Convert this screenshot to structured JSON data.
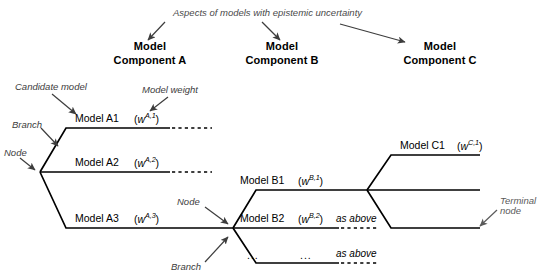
{
  "figure": {
    "caption_top": "Aspects of models with epistemic uncertainty",
    "headers": [
      {
        "line1": "Model",
        "line2": "Component A"
      },
      {
        "line1": "Model",
        "line2": "Component B"
      },
      {
        "line1": "Model",
        "line2": "Component C"
      }
    ],
    "annotations": {
      "candidate_model": "Candidate model",
      "model_weight": "Model weight",
      "branch_left": "Branch",
      "node_left": "Node",
      "node_mid": "Node",
      "branch_mid": "Branch",
      "terminal_node_line1": "Terminal",
      "terminal_node_line2": "node"
    },
    "branches": [
      {
        "model": "Model A1",
        "weight_base": "w",
        "weight_sup": "A,1",
        "note": ""
      },
      {
        "model": "Model A2",
        "weight_base": "w",
        "weight_sup": "A,2",
        "note": ""
      },
      {
        "model": "Model A3",
        "weight_base": "w",
        "weight_sup": "A,3",
        "note": ""
      },
      {
        "model": "Model B1",
        "weight_base": "w",
        "weight_sup": "B,1",
        "note": ""
      },
      {
        "model": "Model B2",
        "weight_base": "w",
        "weight_sup": "B,2",
        "note": "as above"
      },
      {
        "model": "...",
        "weight_base": "...",
        "weight_sup": "",
        "note": "as above"
      },
      {
        "model": "Model C1",
        "weight_base": "w",
        "weight_sup": "C,1",
        "note": ""
      }
    ],
    "colors": {
      "line": "#000000",
      "annotation": "#5a5a5a",
      "background": "#ffffff"
    }
  }
}
